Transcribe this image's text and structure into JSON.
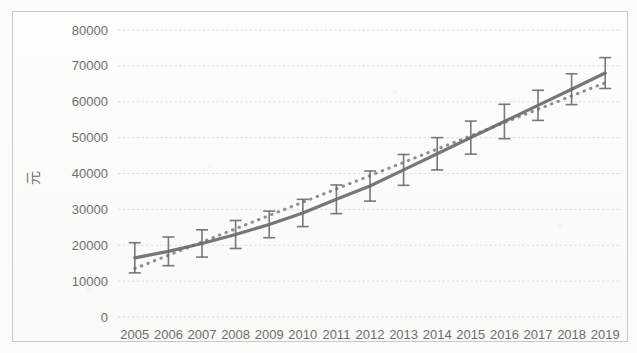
{
  "chart_data": {
    "type": "line",
    "title": "",
    "subtitle": "",
    "xlabel": "",
    "ylabel": "元",
    "ylim": [
      0,
      80000
    ],
    "ytick_labels": [
      "80000",
      "70000",
      "60000",
      "50000",
      "40000",
      "30000",
      "20000",
      "10000",
      "0"
    ],
    "ytick_values": [
      80000,
      70000,
      60000,
      50000,
      40000,
      30000,
      20000,
      10000,
      0
    ],
    "grid": true,
    "legend": "none",
    "categories": [
      "2005",
      "2006",
      "2007",
      "2008",
      "2009",
      "2010",
      "2011",
      "2012",
      "2013",
      "2014",
      "2015",
      "2016",
      "2017",
      "2018",
      "2019"
    ],
    "series": [
      {
        "name": "均值",
        "style": "solid",
        "color": "#6b6b68",
        "values": [
          16500,
          18300,
          20500,
          23000,
          25800,
          29000,
          32800,
          36500,
          41000,
          45500,
          50000,
          54500,
          59000,
          63500,
          68000
        ],
        "error_plus": [
          4200,
          4000,
          3800,
          3900,
          3700,
          3800,
          4000,
          4200,
          4300,
          4500,
          4600,
          4800,
          4200,
          4300,
          4300
        ],
        "error_minus": [
          4200,
          4000,
          3800,
          3900,
          3700,
          3800,
          4000,
          4200,
          4300,
          4500,
          4600,
          4800,
          4200,
          4300,
          4300
        ]
      },
      {
        "name": "线性趋势线",
        "style": "dotted",
        "color": "#7a7a77",
        "values": [
          13500,
          17200,
          20900,
          24600,
          28300,
          32000,
          35700,
          39400,
          43100,
          46800,
          50500,
          54200,
          57900,
          61600,
          65300
        ]
      }
    ],
    "colors": {
      "line": "#6b6b68",
      "trend": "#7a7a77",
      "grid": "#d7d7d3",
      "text": "#6e6e6b",
      "frame": "#c9c9c6",
      "background": "#fbfbfa"
    }
  }
}
